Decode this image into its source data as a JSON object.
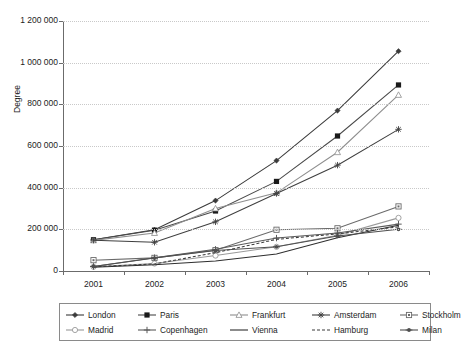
{
  "chart_data": {
    "type": "line",
    "title": "",
    "xlabel": "",
    "ylabel": "Degree",
    "categories": [
      "2001",
      "2002",
      "2003",
      "2004",
      "2005",
      "2006"
    ],
    "ylim": [
      0,
      1200000
    ],
    "ytick_labels": [
      "0",
      "200 000",
      "400 000",
      "600 000",
      "800 000",
      "1 000 000",
      "1 200 000"
    ],
    "ytick_values": [
      0,
      200000,
      400000,
      600000,
      800000,
      1000000,
      1200000
    ],
    "grid": "horizontal-dotted",
    "legend_position": "bottom",
    "series": [
      {
        "name": "London",
        "marker": "diamond-line",
        "dash": "solid",
        "color": "#3a3a3a",
        "values": [
          150000,
          198000,
          338000,
          530000,
          770000,
          1055000
        ]
      },
      {
        "name": "Paris",
        "marker": "square-filled",
        "dash": "solid",
        "color": "#4a4a4a",
        "values": [
          150000,
          196000,
          288000,
          430000,
          648000,
          893000
        ]
      },
      {
        "name": "Frankfurt",
        "marker": "triangle-open",
        "dash": "solid",
        "color": "#8e8e8e",
        "values": [
          147000,
          182000,
          300000,
          375000,
          570000,
          845000
        ]
      },
      {
        "name": "Amsterdam",
        "marker": "star-cross",
        "dash": "solid",
        "color": "#3f3f3f",
        "values": [
          148000,
          138000,
          236000,
          372000,
          508000,
          680000
        ]
      },
      {
        "name": "Stockholm",
        "marker": "square-dotted",
        "dash": "solid",
        "color": "#6a6a6a",
        "values": [
          52000,
          63000,
          100000,
          198000,
          205000,
          310000
        ]
      },
      {
        "name": "Madrid",
        "marker": "circle-open",
        "dash": "solid",
        "color": "#9a9a9a",
        "values": [
          20000,
          36000,
          74000,
          116000,
          172000,
          255000
        ]
      },
      {
        "name": "Copenhagen",
        "marker": "plus",
        "dash": "solid",
        "color": "#5a5a5a",
        "values": [
          22000,
          64000,
          104000,
          158000,
          182000,
          225000
        ]
      },
      {
        "name": "Vienna",
        "marker": "none",
        "dash": "solid",
        "color": "#2e2e2e",
        "values": [
          18000,
          30000,
          48000,
          82000,
          160000,
          220000
        ]
      },
      {
        "name": "Hamburg",
        "marker": "none",
        "dash": "dashed",
        "color": "#3a3a3a",
        "values": [
          20000,
          34000,
          88000,
          152000,
          178000,
          212000
        ]
      },
      {
        "name": "Milan",
        "marker": "dot-line",
        "dash": "solid",
        "color": "#4f4f4f",
        "values": [
          22000,
          62000,
          98000,
          116000,
          168000,
          200000
        ]
      }
    ]
  },
  "legend": {
    "rows": [
      [
        "London",
        "Paris",
        "Frankfurt",
        "Amsterdam",
        "Stockholm"
      ],
      [
        "Madrid",
        "Copenhagen",
        "Vienna",
        "Hamburg",
        "Milan"
      ]
    ]
  },
  "colors": {
    "axis": "#6b6b6b",
    "grid": "#c9c9c9",
    "text": "#1d1d1d",
    "legend_border": "#8a8a8a",
    "background": "#ffffff"
  }
}
